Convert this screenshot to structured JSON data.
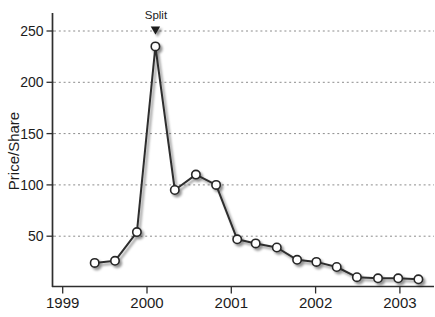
{
  "figure": {
    "background": "#ffffff"
  },
  "chart_data": {
    "type": "line",
    "title": "",
    "xlabel": "",
    "ylabel": "Price/Share",
    "x_ticks": [
      1999,
      2000,
      2001,
      2002,
      2003
    ],
    "x_tick_labels": [
      "1999",
      "2000",
      "2001",
      "2002",
      "2003"
    ],
    "y_ticks": [
      50,
      100,
      150,
      200,
      250
    ],
    "y_tick_labels": [
      "50",
      "100",
      "150",
      "200",
      "250"
    ],
    "xlim": [
      1998.88,
      2003.4
    ],
    "ylim": [
      0,
      268
    ],
    "grid": {
      "horizontal": true,
      "vertical": false,
      "style": "dashed",
      "color": "#8c8c8c"
    },
    "legend": null,
    "series": [
      {
        "name": "price-per-share",
        "marker": "open-circle",
        "x": [
          1999.38,
          1999.62,
          1999.88,
          2000.1,
          2000.33,
          2000.58,
          2000.82,
          2001.07,
          2001.29,
          2001.54,
          2001.78,
          2002.01,
          2002.25,
          2002.49,
          2002.74,
          2002.98,
          2003.22
        ],
        "y": [
          24,
          26,
          54,
          235,
          95,
          110,
          100,
          47,
          43,
          39,
          27,
          25,
          20,
          10,
          9,
          9,
          8
        ]
      }
    ],
    "annotations": [
      {
        "type": "triangle-down",
        "label": "Split",
        "x": 2000.1,
        "y": 250
      }
    ],
    "colors": {
      "line": "#2e2e2e",
      "marker_fill": "#ffffff",
      "marker_stroke": "#262626",
      "axis": "#2e2e2e",
      "grid": "#8c8c8c",
      "text": "#1c1c1c",
      "annotation": "#1a1a1a"
    }
  }
}
